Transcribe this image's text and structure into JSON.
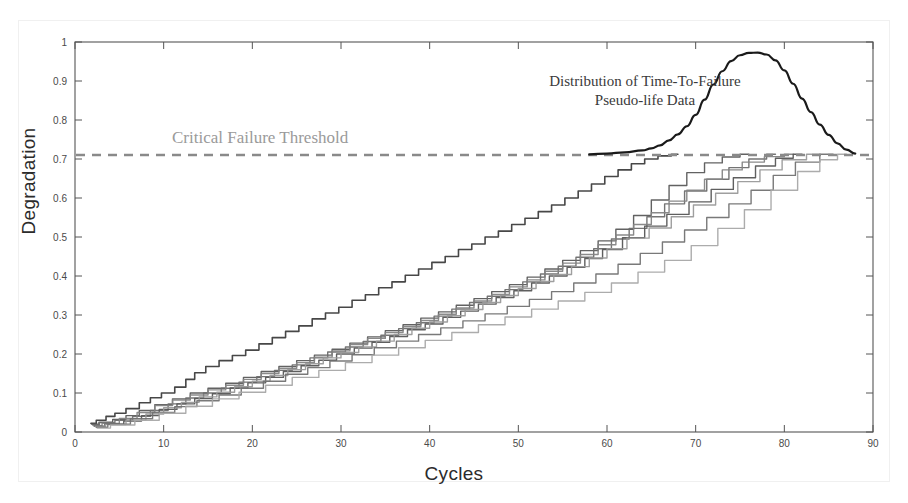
{
  "figure": {
    "background_color": "#ffffff",
    "frame_color": "#555555"
  },
  "annotations": {
    "threshold_label": "Critical Failure Threshold",
    "threshold_label_color": "#9a9a9a",
    "distribution_label_line1": "Distribution of Time-To-Failure",
    "distribution_label_line2": "Pseudo-life Data"
  },
  "chart_data": {
    "type": "line",
    "title": "",
    "subtitle": "",
    "xlabel": "Cycles",
    "ylabel": "Degradation",
    "xlim": [
      0,
      90
    ],
    "ylim": [
      0,
      1
    ],
    "xticks": [
      0,
      10,
      20,
      30,
      40,
      50,
      60,
      70,
      80,
      90
    ],
    "xtick_labels": [
      "0",
      "10",
      "20",
      "30",
      "40",
      "50",
      "60",
      "70",
      "80",
      "90"
    ],
    "yticks": [
      0,
      0.1,
      0.2,
      0.3,
      0.4,
      0.5,
      0.6,
      0.7,
      0.8,
      0.9,
      1
    ],
    "ytick_labels": [
      "0",
      "0.1",
      "0.2",
      "0.3",
      "0.4",
      "0.5",
      "0.6",
      "0.7",
      "0.8",
      "0.9",
      "1"
    ],
    "grid": false,
    "legend_position": "none",
    "annotations": [
      {
        "text": "Critical Failure Threshold",
        "x": 11,
        "y": 0.755,
        "color": "#9a9a9a"
      },
      {
        "text": "Distribution of Time-To-Failure Pseudo-life Data",
        "x": 62,
        "y": 0.9,
        "color": "#3a3a3a"
      }
    ],
    "threshold_line": {
      "label": "Critical Failure Threshold",
      "value": 0.71,
      "style": "dashed",
      "color": "#8a8a8a",
      "width": 2.5
    },
    "distribution_curve": {
      "name": "Time-To-Failure Pseudo-life Distribution",
      "color": "#1a1a1a",
      "width": 2.2,
      "baseline": 0.71,
      "peak_x": 77.2,
      "peak_y": 0.973,
      "x": [
        58,
        60,
        62,
        64,
        65,
        66,
        67,
        68,
        69,
        70,
        71,
        72,
        73,
        74,
        75,
        76,
        77,
        78,
        79,
        80,
        81,
        82,
        83,
        84,
        85,
        86,
        87,
        88
      ],
      "y": [
        0.712,
        0.714,
        0.717,
        0.722,
        0.727,
        0.735,
        0.748,
        0.763,
        0.784,
        0.813,
        0.852,
        0.891,
        0.925,
        0.951,
        0.966,
        0.972,
        0.973,
        0.968,
        0.953,
        0.927,
        0.893,
        0.855,
        0.82,
        0.788,
        0.762,
        0.74,
        0.724,
        0.714
      ]
    },
    "series": [
      {
        "name": "path-1-leading",
        "color": "#3d3d3d",
        "width": 1.6,
        "failure_cycle": 68,
        "x": [
          1.8,
          3,
          4,
          5,
          6.5,
          8,
          9,
          10.5,
          12,
          13,
          14,
          15.5,
          17,
          18.5,
          20,
          21.5,
          23,
          24.5,
          26,
          27.5,
          29,
          30.5,
          32,
          33.5,
          35,
          36.5,
          38,
          39.5,
          41,
          42.5,
          44,
          45.5,
          47,
          48.5,
          50,
          51.5,
          53,
          54.5,
          56,
          57.5,
          59,
          60.5,
          62,
          63.5,
          65,
          66.5,
          68
        ],
        "y": [
          0.022,
          0.03,
          0.04,
          0.048,
          0.06,
          0.075,
          0.088,
          0.1,
          0.115,
          0.135,
          0.152,
          0.168,
          0.183,
          0.196,
          0.21,
          0.226,
          0.242,
          0.258,
          0.272,
          0.29,
          0.305,
          0.32,
          0.338,
          0.352,
          0.37,
          0.385,
          0.402,
          0.418,
          0.435,
          0.45,
          0.468,
          0.482,
          0.5,
          0.515,
          0.532,
          0.548,
          0.565,
          0.582,
          0.6,
          0.618,
          0.636,
          0.655,
          0.672,
          0.688,
          0.7,
          0.708,
          0.712
        ]
      },
      {
        "name": "path-2",
        "color": "#5a5a5a",
        "width": 1.4,
        "failure_cycle": 76,
        "x": [
          1.9,
          3.5,
          5,
          6.5,
          8,
          10,
          12,
          14,
          16,
          18,
          20,
          22,
          24,
          26,
          28,
          30,
          32,
          34,
          36,
          38,
          40,
          42,
          44,
          46,
          48,
          50,
          52,
          54,
          56,
          58,
          60,
          62,
          64,
          66,
          68,
          70,
          72,
          74,
          76
        ],
        "y": [
          0.02,
          0.025,
          0.032,
          0.042,
          0.055,
          0.07,
          0.085,
          0.1,
          0.112,
          0.125,
          0.14,
          0.155,
          0.168,
          0.183,
          0.197,
          0.212,
          0.228,
          0.244,
          0.26,
          0.275,
          0.292,
          0.308,
          0.325,
          0.342,
          0.36,
          0.378,
          0.397,
          0.418,
          0.44,
          0.465,
          0.49,
          0.52,
          0.555,
          0.595,
          0.632,
          0.665,
          0.69,
          0.705,
          0.712
        ]
      },
      {
        "name": "path-3",
        "color": "#6d6d6d",
        "width": 1.4,
        "failure_cycle": 79,
        "x": [
          2,
          3.5,
          5.5,
          7.5,
          9.5,
          11.5,
          13.5,
          15.5,
          17.5,
          19.5,
          21.5,
          23.5,
          25.5,
          27.5,
          29.5,
          31.5,
          33.5,
          35.5,
          37.5,
          39.5,
          41.5,
          43.5,
          45.5,
          47.5,
          49.5,
          51.5,
          53.5,
          55.5,
          57.5,
          59.5,
          61.5,
          63.5,
          65.5,
          67.5,
          70,
          72.5,
          75,
          77,
          79
        ],
        "y": [
          0.018,
          0.024,
          0.03,
          0.04,
          0.055,
          0.072,
          0.087,
          0.1,
          0.112,
          0.128,
          0.142,
          0.158,
          0.172,
          0.19,
          0.205,
          0.218,
          0.232,
          0.248,
          0.265,
          0.28,
          0.297,
          0.315,
          0.332,
          0.348,
          0.365,
          0.385,
          0.405,
          0.425,
          0.448,
          0.47,
          0.495,
          0.522,
          0.552,
          0.585,
          0.618,
          0.648,
          0.678,
          0.7,
          0.712
        ]
      },
      {
        "name": "path-4",
        "color": "#848484",
        "width": 1.4,
        "failure_cycle": 81,
        "x": [
          2.1,
          4,
          6,
          8,
          10,
          12,
          14,
          16,
          18,
          20,
          22,
          24,
          26,
          28,
          30,
          32,
          34,
          36,
          38,
          40,
          42,
          44,
          46,
          48,
          50,
          52,
          54,
          56,
          58,
          60,
          62,
          64,
          66,
          68,
          70,
          72,
          74,
          76.5,
          79,
          81
        ],
        "y": [
          0.016,
          0.022,
          0.035,
          0.05,
          0.068,
          0.082,
          0.095,
          0.108,
          0.12,
          0.135,
          0.15,
          0.163,
          0.178,
          0.192,
          0.208,
          0.224,
          0.24,
          0.255,
          0.27,
          0.286,
          0.302,
          0.318,
          0.336,
          0.353,
          0.372,
          0.39,
          0.412,
          0.433,
          0.455,
          0.48,
          0.505,
          0.532,
          0.562,
          0.592,
          0.62,
          0.648,
          0.672,
          0.692,
          0.706,
          0.712
        ]
      },
      {
        "name": "path-5",
        "color": "#565656",
        "width": 1.4,
        "failure_cycle": 82,
        "x": [
          2.2,
          4.5,
          6.5,
          8.5,
          10.5,
          12.5,
          14.5,
          16.5,
          18.5,
          20.5,
          22.5,
          24.5,
          26.5,
          28.5,
          30.5,
          32.5,
          34.5,
          36.5,
          38.5,
          40.5,
          42.5,
          44.5,
          46.5,
          48.5,
          50.5,
          52.5,
          54.5,
          56.5,
          58.5,
          60.5,
          63,
          65.5,
          68,
          70.5,
          73,
          75.5,
          78,
          80,
          82
        ],
        "y": [
          0.015,
          0.02,
          0.028,
          0.042,
          0.058,
          0.072,
          0.086,
          0.098,
          0.113,
          0.126,
          0.14,
          0.155,
          0.17,
          0.184,
          0.2,
          0.215,
          0.23,
          0.245,
          0.262,
          0.277,
          0.294,
          0.31,
          0.328,
          0.345,
          0.362,
          0.382,
          0.4,
          0.422,
          0.445,
          0.468,
          0.498,
          0.528,
          0.558,
          0.59,
          0.622,
          0.652,
          0.682,
          0.702,
          0.712
        ]
      },
      {
        "name": "path-6",
        "color": "#9a9a9a",
        "width": 1.4,
        "failure_cycle": 84,
        "x": [
          2.3,
          4.5,
          7,
          9,
          11,
          13,
          15,
          17,
          19,
          21,
          23,
          25,
          27,
          29,
          31,
          33,
          35,
          37,
          39,
          41,
          43,
          45,
          47,
          49,
          51,
          53,
          55,
          57,
          59,
          61,
          63.5,
          66,
          68.5,
          71,
          73.5,
          76,
          78.5,
          81,
          84
        ],
        "y": [
          0.014,
          0.019,
          0.03,
          0.046,
          0.062,
          0.076,
          0.09,
          0.102,
          0.116,
          0.13,
          0.145,
          0.16,
          0.175,
          0.19,
          0.204,
          0.218,
          0.233,
          0.25,
          0.266,
          0.282,
          0.298,
          0.314,
          0.332,
          0.35,
          0.368,
          0.386,
          0.404,
          0.424,
          0.446,
          0.47,
          0.497,
          0.523,
          0.552,
          0.582,
          0.612,
          0.642,
          0.672,
          0.698,
          0.712
        ]
      },
      {
        "name": "path-7",
        "color": "#727272",
        "width": 1.4,
        "failure_cycle": 85.5,
        "x": [
          2.4,
          5,
          7.5,
          10,
          12.5,
          15,
          17.5,
          20,
          22.5,
          25,
          27.5,
          30,
          32.5,
          35,
          37.5,
          40,
          42.5,
          45,
          47.5,
          50,
          52.5,
          55,
          57.5,
          60,
          62.5,
          65,
          67.5,
          70,
          72.5,
          75,
          77.5,
          80,
          82.5,
          85.5
        ],
        "y": [
          0.012,
          0.02,
          0.034,
          0.05,
          0.065,
          0.08,
          0.095,
          0.112,
          0.13,
          0.148,
          0.165,
          0.182,
          0.198,
          0.216,
          0.233,
          0.25,
          0.267,
          0.285,
          0.303,
          0.322,
          0.34,
          0.36,
          0.382,
          0.405,
          0.43,
          0.458,
          0.487,
          0.518,
          0.55,
          0.585,
          0.62,
          0.658,
          0.692,
          0.712
        ]
      },
      {
        "name": "path-8-trailing",
        "color": "#a8a8a8",
        "width": 1.4,
        "failure_cycle": 87,
        "x": [
          2.5,
          5.5,
          8,
          11,
          14,
          17,
          20,
          23,
          26,
          29,
          32,
          35,
          38,
          41,
          44,
          47,
          50,
          53,
          56,
          59,
          62,
          65,
          68,
          71,
          74,
          77,
          80,
          83,
          85,
          87
        ],
        "y": [
          0.01,
          0.018,
          0.03,
          0.048,
          0.066,
          0.085,
          0.102,
          0.12,
          0.14,
          0.158,
          0.178,
          0.197,
          0.216,
          0.235,
          0.255,
          0.275,
          0.295,
          0.315,
          0.336,
          0.358,
          0.382,
          0.41,
          0.44,
          0.478,
          0.522,
          0.57,
          0.62,
          0.668,
          0.698,
          0.712
        ]
      }
    ]
  }
}
